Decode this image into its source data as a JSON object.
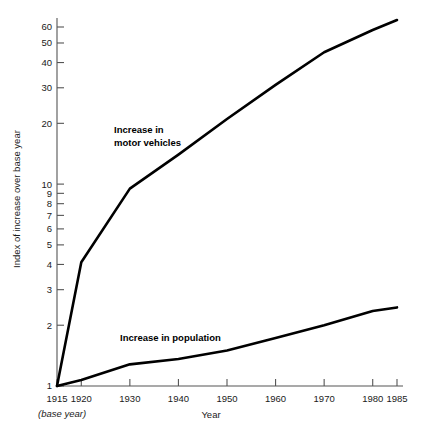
{
  "chart_data": {
    "type": "line",
    "title": "",
    "xlabel": "Year",
    "ylabel": "Index of increase over base year",
    "base_note": "(base year)",
    "yscale": "log",
    "ylim": [
      1,
      70
    ],
    "xlim": [
      1915,
      1985
    ],
    "grid": false,
    "legend_position": "inline-annotation",
    "x_ticks": [
      {
        "value": 1915,
        "label": "1915"
      },
      {
        "value": 1920,
        "label": "1920"
      },
      {
        "value": 1930,
        "label": "1930"
      },
      {
        "value": 1940,
        "label": "1940"
      },
      {
        "value": 1950,
        "label": "1950"
      },
      {
        "value": 1960,
        "label": "1960"
      },
      {
        "value": 1970,
        "label": "1970"
      },
      {
        "value": 1980,
        "label": "1980"
      },
      {
        "value": 1985,
        "label": "1985"
      }
    ],
    "y_ticks": [
      {
        "value": 1,
        "label": "1"
      },
      {
        "value": 2,
        "label": "2"
      },
      {
        "value": 3,
        "label": "3"
      },
      {
        "value": 4,
        "label": "4"
      },
      {
        "value": 5,
        "label": "5"
      },
      {
        "value": 6,
        "label": "6"
      },
      {
        "value": 7,
        "label": "7"
      },
      {
        "value": 8,
        "label": "8"
      },
      {
        "value": 9,
        "label": "9"
      },
      {
        "value": 10,
        "label": "10"
      },
      {
        "value": 20,
        "label": "20"
      },
      {
        "value": 30,
        "label": "30"
      },
      {
        "value": 40,
        "label": "40"
      },
      {
        "value": 50,
        "label": "50"
      },
      {
        "value": 60,
        "label": "60"
      }
    ],
    "series": [
      {
        "name": "Increase in motor vehicles",
        "annotation_lines": [
          "Increase in",
          "motor vehicles"
        ],
        "color": "#000000",
        "x": [
          1915,
          1920,
          1930,
          1940,
          1950,
          1960,
          1970,
          1980,
          1985
        ],
        "values": [
          1,
          4.1,
          9.5,
          14,
          21,
          31,
          45,
          58,
          65
        ]
      },
      {
        "name": "Increase in population",
        "annotation_lines": [
          "Increase in population"
        ],
        "color": "#000000",
        "x": [
          1915,
          1920,
          1930,
          1940,
          1950,
          1960,
          1970,
          1980,
          1985
        ],
        "values": [
          1,
          1.07,
          1.28,
          1.36,
          1.5,
          1.73,
          2.0,
          2.35,
          2.45
        ]
      }
    ]
  }
}
